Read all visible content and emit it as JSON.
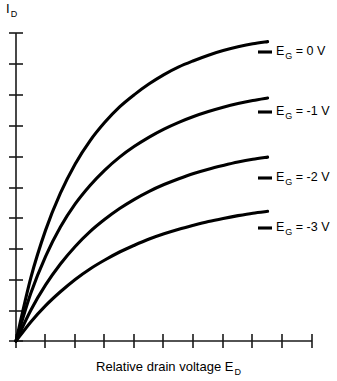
{
  "figure": {
    "background_color": "#ffffff",
    "axis_color": "#1a1a1a",
    "curve_color": "#000000",
    "y_axis_title_main": "I",
    "y_axis_title_sub": "D",
    "x_axis_title_main": "Relative drain voltage E",
    "x_axis_title_sub": "D"
  },
  "curve_labels": [
    {
      "prefix": "E",
      "sub": "G",
      "suffix": " = 0 V"
    },
    {
      "prefix": "E",
      "sub": "G",
      "suffix": " = -1 V"
    },
    {
      "prefix": "E",
      "sub": "G",
      "suffix": " = -2 V"
    },
    {
      "prefix": "E",
      "sub": "G",
      "suffix": " = -3 V"
    }
  ],
  "chart_data": {
    "type": "line",
    "title": "",
    "subtitle": "",
    "xlabel": "Relative drain voltage E_D",
    "ylabel": "I_D",
    "xlim": [
      0,
      10
    ],
    "ylim": [
      0,
      10
    ],
    "grid": false,
    "legend_position": "inline-right-of-curve-ends",
    "x_ticks": [
      0,
      1,
      2,
      3,
      4,
      5,
      6,
      7,
      8,
      9,
      10
    ],
    "x_tick_labels": [],
    "y_ticks": [
      0,
      1,
      2,
      3,
      4,
      5,
      6,
      7,
      8,
      9,
      10
    ],
    "y_tick_labels": [],
    "annotations": [
      "E_G = 0 V",
      "E_G = -1 V",
      "E_G = -2 V",
      "E_G = -3 V"
    ],
    "x": [
      0,
      0.5,
      1,
      1.5,
      2,
      2.5,
      3,
      3.5,
      4,
      4.5,
      5,
      5.5,
      6,
      6.5,
      7,
      7.5,
      8,
      8.5
    ],
    "series": [
      {
        "name": "E_G = 0 V",
        "values": [
          0,
          2.05,
          3.6,
          4.8,
          5.75,
          6.5,
          7.1,
          7.6,
          8.0,
          8.35,
          8.65,
          8.9,
          9.1,
          9.28,
          9.43,
          9.55,
          9.65,
          9.72
        ]
      },
      {
        "name": "E_G = -1 V",
        "values": [
          0,
          1.55,
          2.75,
          3.7,
          4.45,
          5.05,
          5.55,
          5.97,
          6.32,
          6.62,
          6.88,
          7.1,
          7.29,
          7.45,
          7.59,
          7.71,
          7.81,
          7.89
        ]
      },
      {
        "name": "E_G = -2 V",
        "values": [
          0,
          1.0,
          1.82,
          2.5,
          3.07,
          3.55,
          3.95,
          4.3,
          4.6,
          4.86,
          5.08,
          5.27,
          5.44,
          5.58,
          5.7,
          5.81,
          5.9,
          5.97
        ]
      },
      {
        "name": "E_G = -3 V",
        "values": [
          0,
          0.62,
          1.15,
          1.6,
          2.0,
          2.34,
          2.63,
          2.89,
          3.11,
          3.31,
          3.48,
          3.63,
          3.76,
          3.88,
          3.98,
          4.07,
          4.15,
          4.21
        ]
      }
    ]
  }
}
